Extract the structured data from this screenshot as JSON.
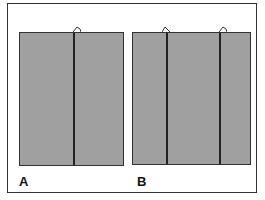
{
  "labels": {
    "a": "A",
    "b": "B"
  },
  "colors": {
    "panel": "#a0a0a0",
    "line": "#222222"
  }
}
